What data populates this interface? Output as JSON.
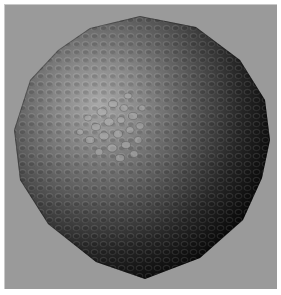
{
  "image": {
    "subject": "sculpted-bumpy-sphere",
    "background_color": "#9a9a9a",
    "frame_color": "#ffffff",
    "highlight_color": "#b4b4b4",
    "shadow_color": "#050505"
  }
}
